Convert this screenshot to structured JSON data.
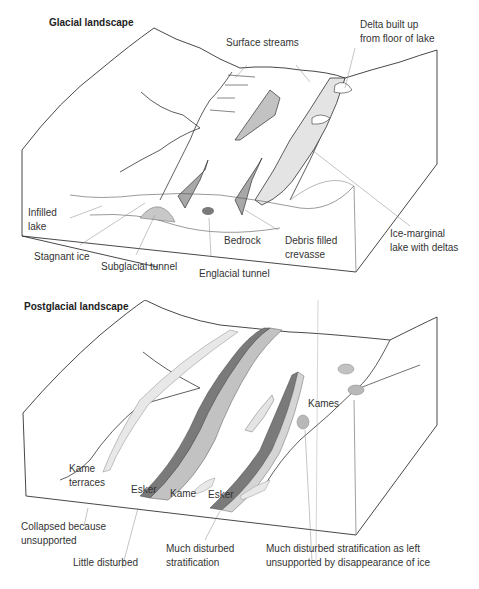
{
  "colors": {
    "outline": "#333333",
    "leader": "#888888",
    "light_fill": "#e4e4e4",
    "mid_fill": "#c2c2c2",
    "dark_fill": "#7a7a7a",
    "hatch": "#cfcfcf"
  },
  "glacial": {
    "title": "Glacial landscape",
    "labels": {
      "surface_streams": "Surface streams",
      "delta": "Delta built up\nfrom floor of lake",
      "infilled_lake": "Infilled\nlake",
      "stagnant_ice": "Stagnant ice",
      "subglacial_tunnel": "Subglacial tunnel",
      "englacial_tunnel": "Englacial tunnel",
      "bedrock": "Bedrock",
      "debris_crevasse": "Debris filled\ncrevasse",
      "ice_marginal_lake": "Ice-marginal\nlake with deltas"
    }
  },
  "postglacial": {
    "title": "Postglacial landscape",
    "labels": {
      "kames_top": "Kames",
      "kame_terraces": "Kame\nterraces",
      "esker_left": "Esker",
      "kame": "Kame",
      "esker_right": "Esker",
      "collapsed": "Collapsed because\nunsupported",
      "little_disturbed": "Little disturbed",
      "much_disturbed": "Much disturbed\nstratification",
      "much_disturbed_left": "Much disturbed stratification as left\nunsupported by disappearance of ice"
    }
  }
}
